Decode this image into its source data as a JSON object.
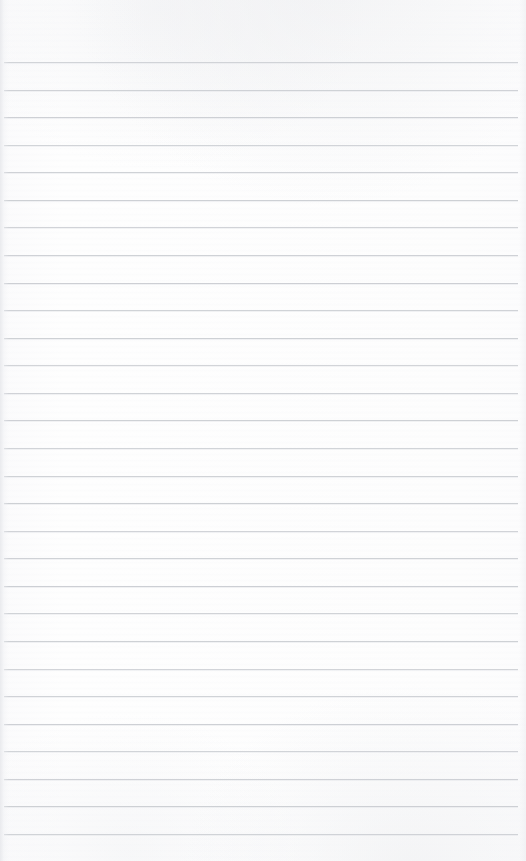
{
  "document": {
    "kind": "scanned-blank-ruled-notebook-page",
    "page_text": "",
    "has_handwriting": false,
    "has_printed_text": false,
    "orientation": "portrait"
  },
  "canvas": {
    "width": 526,
    "height": 861,
    "paper_color": "#fdfdfd",
    "background_color": "#ffffff"
  },
  "ruling": {
    "line_color": "#c8cbd0",
    "line_thickness_px": 1,
    "line_count": 29,
    "first_line_y": 62,
    "line_spacing_px": 27.57,
    "line_left_x": 4,
    "line_right_x": 518,
    "top_margin_px": 62,
    "bottom_margin_px": 27,
    "y_positions": [
      62,
      89.6,
      117.1,
      144.7,
      172.3,
      199.9,
      227.4,
      255,
      282.6,
      310.1,
      337.7,
      365.3,
      392.9,
      420.4,
      448,
      475.6,
      503.1,
      530.7,
      558.3,
      585.9,
      613.4,
      641,
      668.6,
      696.1,
      723.7,
      751.3,
      778.9,
      806.4,
      834
    ]
  },
  "artifacts": {
    "left_seam_color": "#e4e5e9",
    "top_mottle_color": "#e9eaed",
    "bottom_mottle_color": "#eaebee",
    "scan_banding_color": "#f3f4f7"
  }
}
